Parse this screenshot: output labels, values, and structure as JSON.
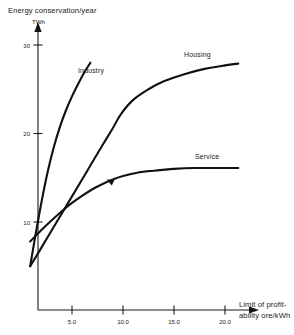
{
  "chart_data": {
    "type": "line",
    "title": "",
    "ylabel": "Energy conservation/year",
    "yunit": "TWh",
    "xlabel_line1": "Limit of profit-",
    "xlabel_line2": "ability ore/kWh",
    "xlabel": "Limit of profitability ore/kWh",
    "grid": false,
    "legend_position": "inline-curve-labels",
    "xlim": [
      0,
      22.5
    ],
    "ylim": [
      0,
      31.5
    ],
    "xticks": [
      5.0,
      10.0,
      15.0,
      20.0
    ],
    "xtick_labels": [
      "5.0",
      "10.0",
      "15.0",
      "20.0"
    ],
    "yticks": [
      10,
      20,
      30
    ],
    "ytick_labels": [
      "10",
      "20",
      "30"
    ],
    "series": [
      {
        "name": "Industry",
        "label": "Industry",
        "x": [
          0.9,
          1.4,
          2.0,
          2.6,
          3.2,
          3.8,
          4.4,
          5.0,
          5.6,
          6.2,
          6.8
        ],
        "y": [
          5.0,
          8.4,
          12.2,
          15.6,
          18.4,
          20.7,
          22.6,
          24.2,
          25.6,
          26.9,
          28.0
        ]
      },
      {
        "name": "Housing",
        "label": "Housing",
        "x": [
          0.9,
          2.0,
          3.5,
          5.0,
          6.5,
          8.0,
          9.0,
          9.8,
          11.0,
          12.5,
          14.0,
          16.0,
          18.0,
          20.0,
          21.3
        ],
        "y": [
          5.0,
          7.1,
          10.0,
          12.9,
          15.8,
          18.7,
          20.6,
          22.2,
          23.8,
          25.0,
          25.9,
          26.7,
          27.3,
          27.7,
          27.9
        ]
      },
      {
        "name": "Service",
        "label": "Service",
        "x": [
          0.9,
          2.0,
          3.2,
          4.5,
          5.8,
          7.0,
          8.0,
          9.0,
          10.0,
          11.5,
          13.0,
          15.0,
          17.0,
          19.0,
          21.3
        ],
        "y": [
          7.8,
          9.1,
          10.4,
          11.7,
          12.8,
          13.7,
          14.3,
          14.8,
          15.2,
          15.6,
          15.8,
          16.0,
          16.1,
          16.1,
          16.1
        ]
      }
    ],
    "annotations": [
      {
        "name": "service-curve-arrow",
        "x": 8.4,
        "y": 14.8
      }
    ],
    "colors": {
      "axis": "#1a1a1a",
      "curve": "#111111",
      "background": "#ffffff"
    }
  },
  "labels": {
    "y_axis_title": "Energy conservation/year",
    "y_axis_unit": "TWh",
    "x_axis_title_line1": "Limit of profit-",
    "x_axis_title_line2": "ability ore/kWh",
    "series_industry": "Industry",
    "series_housing": "Housing",
    "series_service": "Service",
    "ytick_30": "30",
    "ytick_20": "20",
    "ytick_10": "10",
    "xtick_5": "5.0",
    "xtick_10": "10.0",
    "xtick_15": "15.0",
    "xtick_20": "20.0"
  }
}
